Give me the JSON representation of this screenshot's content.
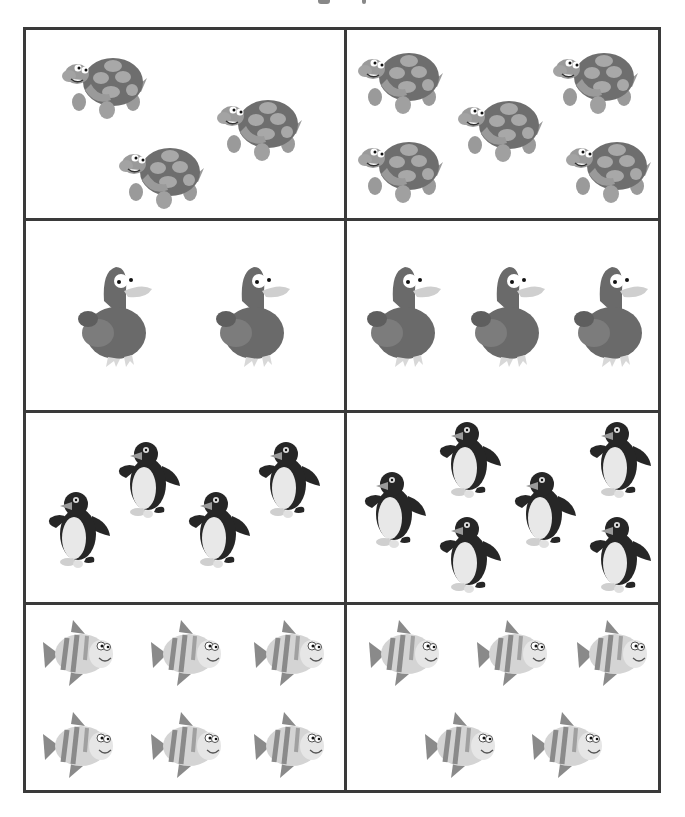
{
  "worksheet": {
    "type": "counting-comparison",
    "rows": [
      {
        "animal": "turtle",
        "left": {
          "count": 3,
          "positions": [
            [
              35,
              20
            ],
            [
              190,
              62
            ],
            [
              92,
              110
            ]
          ]
        },
        "right": {
          "count": 5,
          "positions": [
            [
              10,
              15
            ],
            [
              205,
              15
            ],
            [
              110,
              63
            ],
            [
              10,
              104
            ],
            [
              218,
              104
            ]
          ]
        }
      },
      {
        "animal": "duck",
        "left": {
          "count": 2,
          "positions": [
            [
              50,
              40
            ],
            [
              188,
              40
            ]
          ]
        },
        "right": {
          "count": 3,
          "positions": [
            [
              18,
              40
            ],
            [
              122,
              40
            ],
            [
              225,
              40
            ]
          ]
        }
      },
      {
        "animal": "penguin",
        "left": {
          "count": 4,
          "positions": [
            [
              20,
              75
            ],
            [
              90,
              25
            ],
            [
              160,
              75
            ],
            [
              230,
              25
            ]
          ]
        },
        "right": {
          "count": 6,
          "positions": [
            [
              15,
              55
            ],
            [
              90,
              5
            ],
            [
              90,
              100
            ],
            [
              165,
              55
            ],
            [
              240,
              5
            ],
            [
              240,
              100
            ]
          ]
        }
      },
      {
        "animal": "fish",
        "left": {
          "count": 6,
          "positions": [
            [
              15,
              15
            ],
            [
              123,
              15
            ],
            [
              226,
              15
            ],
            [
              15,
              107
            ],
            [
              123,
              107
            ],
            [
              226,
              107
            ]
          ]
        },
        "right": {
          "count": 5,
          "positions": [
            [
              20,
              15
            ],
            [
              128,
              15
            ],
            [
              228,
              15
            ],
            [
              76,
              107
            ],
            [
              183,
              107
            ]
          ]
        }
      }
    ]
  },
  "colors": {
    "border": "#3a3a3a",
    "background": "#ffffff",
    "turtle_shell": "#6e6e6e",
    "turtle_spots": "#a8a8a8",
    "turtle_body": "#9a9a9a",
    "duck_body": "#6a6a6a",
    "duck_wing": "#7c7c7c",
    "penguin_black": "#262626",
    "penguin_belly": "#e8e8e8",
    "fish_body": "#d4d4d4",
    "fish_stripes": "#8a8a8a"
  }
}
